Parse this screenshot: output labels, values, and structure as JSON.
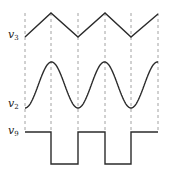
{
  "diagram": {
    "title": "",
    "colors": {
      "wave": "#2b2b2b",
      "guide": "#8a8a8a",
      "background": "#ffffff"
    },
    "guide_x": [
      25,
      51,
      78,
      105,
      131,
      158
    ],
    "guide_y_range": [
      13,
      132
    ],
    "signals": [
      {
        "id": "v3",
        "label_main": "v",
        "label_sub": "3",
        "label_pos": [
          8,
          29
        ],
        "shape": "triangle",
        "high_y": 13,
        "low_y": 37,
        "points": [
          [
            25,
            37
          ],
          [
            51,
            13
          ],
          [
            78,
            37
          ],
          [
            105,
            13
          ],
          [
            131,
            37
          ],
          [
            158,
            14
          ]
        ]
      },
      {
        "id": "v2",
        "label_main": "v",
        "label_sub": "2",
        "label_pos": [
          8,
          98
        ],
        "shape": "sine",
        "high_y": 62,
        "low_y": 108,
        "start_x": 25,
        "end_x": 158,
        "period_px": 53,
        "phase": "minimum at x=25"
      },
      {
        "id": "v9",
        "label_main": "v",
        "label_sub": "9",
        "label_pos": [
          8,
          125
        ],
        "shape": "square",
        "high_y": 132,
        "low_y": 164,
        "points": [
          [
            25,
            132
          ],
          [
            51,
            132
          ],
          [
            51,
            164
          ],
          [
            78,
            164
          ],
          [
            78,
            132
          ],
          [
            105,
            132
          ],
          [
            105,
            164
          ],
          [
            131,
            164
          ],
          [
            131,
            132
          ],
          [
            158,
            132
          ]
        ]
      }
    ]
  }
}
